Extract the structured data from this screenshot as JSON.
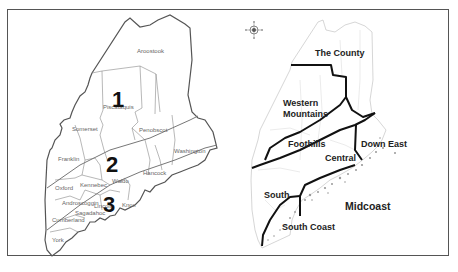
{
  "figure": {
    "frame_color": "#555555"
  },
  "left_map": {
    "title": "Maine counties with zones",
    "zones": [
      {
        "label": "1"
      },
      {
        "label": "2"
      },
      {
        "label": "3"
      }
    ],
    "counties": [
      {
        "name": "Aroostook"
      },
      {
        "name": "Piscataquis"
      },
      {
        "name": "Somerset"
      },
      {
        "name": "Penobscot"
      },
      {
        "name": "Franklin"
      },
      {
        "name": "Washington"
      },
      {
        "name": "Hancock"
      },
      {
        "name": "Oxford"
      },
      {
        "name": "Kennebec"
      },
      {
        "name": "Waldo"
      },
      {
        "name": "Androscoggin"
      },
      {
        "name": "Lincoln"
      },
      {
        "name": "Knox"
      },
      {
        "name": "Sagadahoc"
      },
      {
        "name": "Cumberland"
      },
      {
        "name": "York"
      }
    ]
  },
  "right_map": {
    "title": "Maine regions",
    "compass": "compass-rose",
    "regions": [
      {
        "name": "The County"
      },
      {
        "name": "Western Mountains"
      },
      {
        "name": "Western",
        "line": 1
      },
      {
        "name": "Mountains",
        "line": 2
      },
      {
        "name": "Foothills"
      },
      {
        "name": "Central"
      },
      {
        "name": "Down East"
      },
      {
        "name": "South"
      },
      {
        "name": "Midcoast"
      },
      {
        "name": "South Coast"
      }
    ]
  }
}
